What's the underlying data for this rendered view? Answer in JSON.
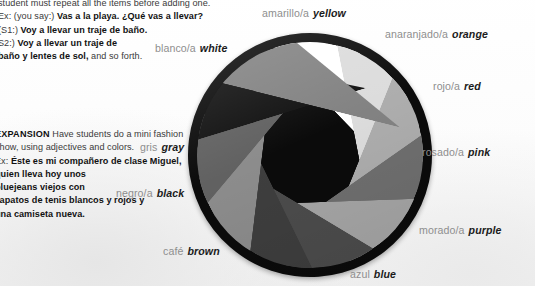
{
  "page": {
    "background_color": "#fdfdfd",
    "body_text_color": "#3a3a3a"
  },
  "lesson_text": {
    "top_paragraph": {
      "lines": [
        "student must repeat all the items before adding one.",
        "Ex: (you say:) Vas a la playa. ¿Qué vas a llevar?",
        "(S1:) Voy a llevar un traje de baño.",
        "S2:) Voy a llevar un traje de",
        "baño y lentes de sol, and so forth."
      ],
      "line1_plain": "student must repeat all the items before adding one.",
      "line2_prefix": "Ex: (you say:) ",
      "line2_bold": "Vas a la playa. ¿Qué vas a llevar?",
      "line3_prefix": "(S1:) ",
      "line3_bold": "Voy a llevar un traje de baño.",
      "line4_prefix": "S2:) ",
      "line4_bold": "Voy a llevar un traje de",
      "line5_bold": "baño y lentes de sol,",
      "line5_suffix": " and so forth."
    },
    "expansion_paragraph": {
      "heading": "EXPANSION",
      "line1_rest": " Have students do a mini fashion",
      "line2": "show, using adjectives and colors.",
      "line3_prefix": "Ex: ",
      "line3_bold": "Éste es mi compañero de clase Miguel,",
      "line4_bold": "quien lleva hoy unos",
      "line5_bold": "bluejeans viejos con",
      "line6_bold": "zapatos de tenis blancos y rojos y",
      "line7_bold": "una camiseta nueva."
    }
  },
  "color_wheel": {
    "title": "Spanish color wheel",
    "center": {
      "x": 310,
      "y": 155
    },
    "radius": 118,
    "ring_color": "#0b0b0b",
    "rotation_deg": -4,
    "segments": [
      {
        "name": "blanco",
        "spanish": "blanco/a",
        "english": "white",
        "swatch": "#ffffff",
        "start_deg": 288,
        "sweep_deg": 32
      },
      {
        "name": "amarillo",
        "spanish": "amarillo/a",
        "english": "yellow",
        "swatch": "#dcdcdc",
        "start_deg": 320,
        "sweep_deg": 33
      },
      {
        "name": "anaranjado",
        "spanish": "anaranjado/a",
        "english": "orange",
        "swatch": "#adadad",
        "start_deg": 353,
        "sweep_deg": 33
      },
      {
        "name": "rojo",
        "spanish": "rojo/a",
        "english": "red",
        "swatch": "#6f6f6f",
        "start_deg": 26,
        "sweep_deg": 33
      },
      {
        "name": "rosado",
        "spanish": "rosado/a",
        "english": "pink",
        "swatch": "#a6a6a6",
        "start_deg": 59,
        "sweep_deg": 33
      },
      {
        "name": "morado",
        "spanish": "morado/a",
        "english": "purple",
        "swatch": "#4c4c4c",
        "start_deg": 92,
        "sweep_deg": 33
      },
      {
        "name": "azul",
        "spanish": "azul",
        "english": "blue",
        "swatch": "#3e3e3e",
        "start_deg": 125,
        "sweep_deg": 33
      },
      {
        "name": "gris-claro",
        "spanish": "",
        "english": "",
        "swatch": "#8c8c8c",
        "start_deg": 158,
        "sweep_deg": 33
      },
      {
        "name": "cafe",
        "spanish": "café",
        "english": "brown",
        "swatch": "#616161",
        "start_deg": 191,
        "sweep_deg": 33
      },
      {
        "name": "negro",
        "spanish": "negro/a",
        "english": "black",
        "swatch": "#111111",
        "start_deg": 224,
        "sweep_deg": 33
      },
      {
        "name": "gris",
        "spanish": "gris",
        "english": "gray",
        "swatch": "#828282",
        "start_deg": 257,
        "sweep_deg": 31
      }
    ],
    "labels": [
      {
        "key": "amarillo",
        "spanish": "amarillo/a",
        "english": "yellow"
      },
      {
        "key": "anaranjado",
        "spanish": "anaranjado/a",
        "english": "orange"
      },
      {
        "key": "rojo",
        "spanish": "rojo/a",
        "english": "red"
      },
      {
        "key": "rosado",
        "spanish": "rosado/a",
        "english": "pink"
      },
      {
        "key": "morado",
        "spanish": "morado/a",
        "english": "purple"
      },
      {
        "key": "azul",
        "spanish": "azul",
        "english": "blue"
      },
      {
        "key": "cafe",
        "spanish": "café",
        "english": "brown"
      },
      {
        "key": "negro",
        "spanish": "negro/a",
        "english": "black"
      },
      {
        "key": "gris",
        "spanish": "gris",
        "english": "gray"
      },
      {
        "key": "blanco",
        "spanish": "blanco/a",
        "english": "white"
      }
    ]
  }
}
